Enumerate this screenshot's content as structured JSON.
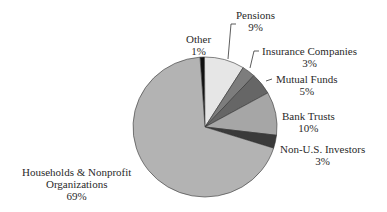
{
  "chart_data": {
    "type": "pie",
    "title": "",
    "categories": [
      "Other",
      "Pensions",
      "Insurance Companies",
      "Mutual Funds",
      "Bank Trusts",
      "Non-U.S. Investors",
      "Households & Nonprofit Organizations"
    ],
    "values": [
      1,
      9,
      3,
      5,
      10,
      3,
      69
    ],
    "unit": "%",
    "colors": [
      "#111111",
      "#e6e6e6",
      "#7d7d7d",
      "#666666",
      "#a6a6a6",
      "#3a3a3a",
      "#b3b3b3"
    ],
    "start_angle_deg": -4,
    "direction": "clockwise",
    "legend": "none (direct labels with leader lines)"
  },
  "labels": {
    "other": {
      "name": "Other",
      "pct": "1%"
    },
    "pensions": {
      "name": "Pensions",
      "pct": "9%"
    },
    "insurance": {
      "name": "Insurance Companies",
      "pct": "3%"
    },
    "mutual": {
      "name": "Mutual Funds",
      "pct": "5%"
    },
    "bank": {
      "name": "Bank Trusts",
      "pct": "10%"
    },
    "nonus": {
      "name": "Non-U.S. Investors",
      "pct": "3%"
    },
    "households": {
      "name1": "Households & Nonprofit",
      "name2": "Organizations",
      "pct": "69%"
    }
  }
}
